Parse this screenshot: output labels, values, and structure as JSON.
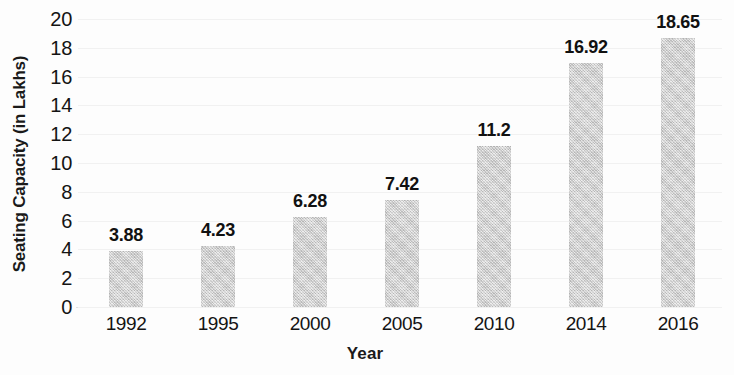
{
  "chart_data": {
    "type": "bar",
    "title": "",
    "xlabel": "Year",
    "ylabel": "Seating Capacity (in Lakhs)",
    "categories": [
      "1992",
      "1995",
      "2000",
      "2005",
      "2010",
      "2014",
      "2016"
    ],
    "values": [
      3.88,
      4.23,
      6.28,
      7.42,
      11.2,
      16.92,
      18.65
    ],
    "data_labels": [
      "3.88",
      "4.23",
      "6.28",
      "7.42",
      "11.2",
      "16.92",
      "18.65"
    ],
    "ylim": [
      0,
      20
    ],
    "ytick_labels": [
      "20",
      "18",
      "16",
      "14",
      "12",
      "10",
      "8",
      "6",
      "4",
      "2",
      "0"
    ],
    "ytick_values": [
      20,
      18,
      16,
      14,
      12,
      10,
      8,
      6,
      4,
      2,
      0
    ],
    "ytick_step": 2,
    "grid": true,
    "legend": false,
    "bar_color": "#c9c9c9",
    "text_color": "#141414",
    "background_color": "#fdfdfd",
    "gridline_color": "#f1f1f1"
  }
}
